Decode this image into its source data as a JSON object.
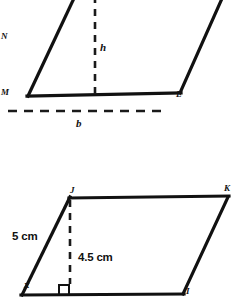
{
  "page": {
    "background_color": "#ffffff",
    "line_color": "#111111",
    "width": 241,
    "height": 297
  },
  "figures": [
    {
      "id": "top-parallelogram",
      "description": "Generic parallelogram with base b and height h, partially cropped at top",
      "vertices": [
        {
          "name": "M",
          "label": "M",
          "x": 28,
          "y": 96
        },
        {
          "name": "L",
          "label": "L",
          "x": 180,
          "y": 93
        },
        {
          "name": "N",
          "label": "N",
          "x": 2,
          "y": 37
        }
      ],
      "labels": {
        "vertex_m": "M",
        "vertex_l": "L",
        "vertex_partial": "N",
        "height": "h",
        "base": "b"
      }
    },
    {
      "id": "bottom-parallelogram",
      "description": "Parallelogram JKLI with side 5 cm, height 4.5 cm, and unknown angle x",
      "vertices": [
        {
          "name": "J",
          "label": "J",
          "x": 70,
          "y": 198
        },
        {
          "name": "K",
          "label": "K",
          "x": 228,
          "y": 197
        },
        {
          "name": "I",
          "label": "I",
          "x": 183,
          "y": 294
        }
      ],
      "labels": {
        "vertex_j": "J",
        "vertex_k": "K",
        "vertex_i": "I",
        "side_length": "5 cm",
        "height_length": "4.5 cm",
        "angle": "x"
      }
    }
  ]
}
